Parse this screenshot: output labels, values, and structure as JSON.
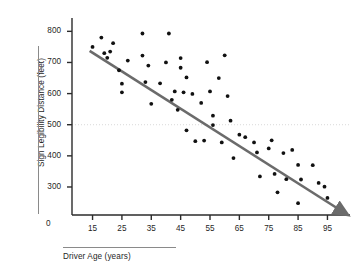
{
  "chart_data": {
    "type": "scatter",
    "title": "",
    "xlabel": "Driver Age (years)",
    "ylabel": "Sign Legibility Distance (feet)",
    "xlim": [
      8,
      102
    ],
    "ylim": [
      210,
      830
    ],
    "grid": false,
    "legend": "none",
    "x_ticks": [
      15,
      25,
      35,
      45,
      55,
      65,
      75,
      85,
      95
    ],
    "y_ticks": [
      300,
      400,
      500,
      600,
      700,
      800
    ],
    "origin_label": "0",
    "reference_line": {
      "orientation": "horizontal",
      "value": 500,
      "style": "dotted",
      "color": "#d9d9d9"
    },
    "trend_line": {
      "type": "linear-fit-arrow",
      "color": "#6b6b6b",
      "x_start": 14,
      "y_start": 737,
      "x_end": 101,
      "y_end": 243,
      "arrowhead": true
    },
    "point_color": "#111111",
    "points": [
      {
        "x": 15,
        "y": 750
      },
      {
        "x": 18,
        "y": 780
      },
      {
        "x": 19,
        "y": 730
      },
      {
        "x": 20,
        "y": 715
      },
      {
        "x": 21,
        "y": 735
      },
      {
        "x": 22,
        "y": 762
      },
      {
        "x": 24,
        "y": 675
      },
      {
        "x": 25,
        "y": 632
      },
      {
        "x": 25,
        "y": 604
      },
      {
        "x": 27,
        "y": 706
      },
      {
        "x": 32,
        "y": 793
      },
      {
        "x": 32,
        "y": 722
      },
      {
        "x": 33,
        "y": 637
      },
      {
        "x": 34,
        "y": 690
      },
      {
        "x": 35,
        "y": 567
      },
      {
        "x": 38,
        "y": 633
      },
      {
        "x": 40,
        "y": 700
      },
      {
        "x": 41,
        "y": 793
      },
      {
        "x": 42,
        "y": 580
      },
      {
        "x": 43,
        "y": 607
      },
      {
        "x": 44,
        "y": 548
      },
      {
        "x": 45,
        "y": 714
      },
      {
        "x": 45,
        "y": 683
      },
      {
        "x": 46,
        "y": 604
      },
      {
        "x": 47,
        "y": 652
      },
      {
        "x": 47,
        "y": 482
      },
      {
        "x": 49,
        "y": 599
      },
      {
        "x": 50,
        "y": 447
      },
      {
        "x": 52,
        "y": 570
      },
      {
        "x": 53,
        "y": 449
      },
      {
        "x": 54,
        "y": 701
      },
      {
        "x": 55,
        "y": 607
      },
      {
        "x": 56,
        "y": 529
      },
      {
        "x": 56,
        "y": 499
      },
      {
        "x": 58,
        "y": 650
      },
      {
        "x": 59,
        "y": 443
      },
      {
        "x": 60,
        "y": 723
      },
      {
        "x": 61,
        "y": 592
      },
      {
        "x": 62,
        "y": 513
      },
      {
        "x": 63,
        "y": 393
      },
      {
        "x": 65,
        "y": 468
      },
      {
        "x": 67,
        "y": 460
      },
      {
        "x": 70,
        "y": 443
      },
      {
        "x": 71,
        "y": 411
      },
      {
        "x": 72,
        "y": 334
      },
      {
        "x": 75,
        "y": 424
      },
      {
        "x": 76,
        "y": 450
      },
      {
        "x": 77,
        "y": 342
      },
      {
        "x": 78,
        "y": 283
      },
      {
        "x": 80,
        "y": 409
      },
      {
        "x": 81,
        "y": 325
      },
      {
        "x": 83,
        "y": 419
      },
      {
        "x": 85,
        "y": 371
      },
      {
        "x": 85,
        "y": 248
      },
      {
        "x": 86,
        "y": 324
      },
      {
        "x": 90,
        "y": 370
      },
      {
        "x": 92,
        "y": 313
      },
      {
        "x": 94,
        "y": 301
      },
      {
        "x": 95,
        "y": 265
      }
    ]
  }
}
